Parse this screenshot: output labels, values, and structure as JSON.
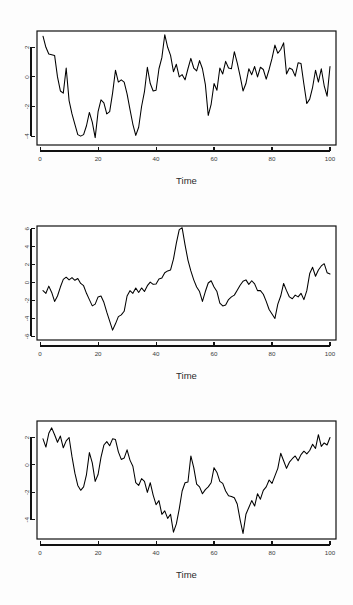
{
  "figure": {
    "kind": "r-base-plot",
    "panel_count": 3,
    "background": "#fdfdfd",
    "line_color": "#000000",
    "axis_color": "#111111"
  },
  "chart_data": [
    {
      "type": "line",
      "title": "",
      "subtitle": "",
      "xlabel": "Time",
      "ylabel": "",
      "grid": false,
      "legend": false,
      "xlim": [
        1,
        100
      ],
      "ylim": [
        -4.6,
        3.1
      ],
      "xticks": [
        0,
        20,
        40,
        60,
        80,
        100
      ],
      "yticks": [
        2,
        0,
        -2,
        -4
      ],
      "xticklabels": [
        "0",
        "20",
        "40",
        "60",
        "80",
        "100"
      ],
      "yticklabels": [
        "2",
        "0",
        "-2",
        "-4"
      ],
      "x": [
        1,
        2,
        3,
        4,
        5,
        6,
        7,
        8,
        9,
        10,
        11,
        12,
        13,
        14,
        15,
        16,
        17,
        18,
        19,
        20,
        21,
        22,
        23,
        24,
        25,
        26,
        27,
        28,
        29,
        30,
        31,
        32,
        33,
        34,
        35,
        36,
        37,
        38,
        39,
        40,
        41,
        42,
        43,
        44,
        45,
        46,
        47,
        48,
        49,
        50,
        51,
        52,
        53,
        54,
        55,
        56,
        57,
        58,
        59,
        60,
        61,
        62,
        63,
        64,
        65,
        66,
        67,
        68,
        69,
        70,
        71,
        72,
        73,
        74,
        75,
        76,
        77,
        78,
        79,
        80,
        81,
        82,
        83,
        84,
        85,
        86,
        87,
        88,
        89,
        90,
        91,
        92,
        93,
        94,
        95,
        96,
        97,
        98,
        99,
        100
      ],
      "values": [
        2.75,
        2.0,
        1.55,
        1.5,
        1.45,
        0.0,
        -0.95,
        -1.1,
        0.6,
        -1.6,
        -2.5,
        -3.2,
        -3.9,
        -4.0,
        -3.9,
        -3.3,
        -2.4,
        -3.05,
        -4.1,
        -2.35,
        -1.55,
        -1.75,
        -2.5,
        -2.35,
        -1.1,
        0.45,
        -0.35,
        -0.2,
        -0.35,
        -1.15,
        -2.2,
        -3.2,
        -3.95,
        -3.4,
        -2.0,
        -1.0,
        0.65,
        -0.45,
        -0.95,
        -0.9,
        0.55,
        1.3,
        2.85,
        2.0,
        1.45,
        0.35,
        0.85,
        0.0,
        0.15,
        -0.2,
        0.55,
        1.25,
        0.6,
        0.4,
        1.1,
        0.55,
        -0.5,
        -2.6,
        -1.85,
        -0.45,
        -0.9,
        0.6,
        0.2,
        1.05,
        0.6,
        0.55,
        1.7,
        0.95,
        0.05,
        -0.95,
        -0.45,
        0.55,
        0.15,
        0.7,
        0.0,
        0.65,
        0.5,
        -0.15,
        0.5,
        1.25,
        2.15,
        1.6,
        1.85,
        2.3,
        0.2,
        0.6,
        0.5,
        0.05,
        0.95,
        0.9,
        -0.5,
        -1.8,
        -1.5,
        -0.7,
        0.45,
        -0.35,
        0.55,
        -0.6,
        -1.3,
        0.7,
        0.35
      ]
    },
    {
      "type": "line",
      "title": "",
      "subtitle": "",
      "xlabel": "Time",
      "ylabel": "",
      "grid": false,
      "legend": false,
      "xlim": [
        1,
        100
      ],
      "ylim": [
        -6.4,
        6.3
      ],
      "xticks": [
        0,
        20,
        40,
        60,
        80,
        100
      ],
      "yticks": [
        6,
        4,
        2,
        0,
        -2,
        -4,
        -6
      ],
      "xticklabels": [
        "0",
        "20",
        "40",
        "60",
        "80",
        "100"
      ],
      "yticklabels": [
        "6",
        "4",
        "2",
        "0",
        "-2",
        "-4",
        "-6"
      ],
      "x": [
        1,
        2,
        3,
        4,
        5,
        6,
        7,
        8,
        9,
        10,
        11,
        12,
        13,
        14,
        15,
        16,
        17,
        18,
        19,
        20,
        21,
        22,
        23,
        24,
        25,
        26,
        27,
        28,
        29,
        30,
        31,
        32,
        33,
        34,
        35,
        36,
        37,
        38,
        39,
        40,
        41,
        42,
        43,
        44,
        45,
        46,
        47,
        48,
        49,
        50,
        51,
        52,
        53,
        54,
        55,
        56,
        57,
        58,
        59,
        60,
        61,
        62,
        63,
        64,
        65,
        66,
        67,
        68,
        69,
        70,
        71,
        72,
        73,
        74,
        75,
        76,
        77,
        78,
        79,
        80,
        81,
        82,
        83,
        84,
        85,
        86,
        87,
        88,
        89,
        90,
        91,
        92,
        93,
        94,
        95,
        96,
        97,
        98,
        99,
        100
      ],
      "values": [
        -0.9,
        -1.2,
        -0.4,
        -1.1,
        -2.1,
        -1.5,
        -0.5,
        0.35,
        0.6,
        0.3,
        0.55,
        0.25,
        0.45,
        -0.1,
        -0.35,
        -1.2,
        -1.9,
        -2.6,
        -2.4,
        -1.6,
        -1.5,
        -2.2,
        -3.3,
        -4.3,
        -5.3,
        -4.6,
        -3.8,
        -3.6,
        -3.2,
        -1.5,
        -0.9,
        -1.2,
        -0.6,
        -1.1,
        -0.6,
        -1.0,
        -0.35,
        0.05,
        -0.2,
        -0.15,
        0.4,
        0.5,
        1.1,
        1.3,
        1.4,
        2.6,
        4.4,
        5.9,
        6.1,
        4.2,
        2.5,
        1.3,
        0.3,
        -0.5,
        -1.0,
        -2.1,
        -1.0,
        -0.05,
        0.2,
        -0.5,
        -1.0,
        -2.3,
        -2.6,
        -2.5,
        -1.9,
        -1.6,
        -1.4,
        -0.85,
        -0.3,
        0.15,
        0.3,
        -0.2,
        0.2,
        -0.15,
        -0.9,
        -0.9,
        -1.3,
        -2.1,
        -3.0,
        -3.5,
        -4.0,
        -2.4,
        -1.5,
        -0.1,
        -0.9,
        -1.6,
        -1.8,
        -1.4,
        -1.6,
        -1.2,
        -1.9,
        -0.9,
        1.0,
        1.7,
        0.7,
        1.4,
        1.85,
        2.1,
        1.1,
        0.95
      ]
    },
    {
      "type": "line",
      "title": "",
      "subtitle": "",
      "xlabel": "Time",
      "ylabel": "",
      "grid": false,
      "legend": false,
      "xlim": [
        1,
        100
      ],
      "ylim": [
        -5.4,
        3.2
      ],
      "xticks": [
        0,
        20,
        40,
        60,
        80,
        100
      ],
      "yticks": [
        2,
        0,
        -2,
        -4
      ],
      "xticklabels": [
        "0",
        "20",
        "40",
        "60",
        "80",
        "100"
      ],
      "yticklabels": [
        "2",
        "0",
        "-2",
        "-4"
      ],
      "x": [
        1,
        2,
        3,
        4,
        5,
        6,
        7,
        8,
        9,
        10,
        11,
        12,
        13,
        14,
        15,
        16,
        17,
        18,
        19,
        20,
        21,
        22,
        23,
        24,
        25,
        26,
        27,
        28,
        29,
        30,
        31,
        32,
        33,
        34,
        35,
        36,
        37,
        38,
        39,
        40,
        41,
        42,
        43,
        44,
        45,
        46,
        47,
        48,
        49,
        50,
        51,
        52,
        53,
        54,
        55,
        56,
        57,
        58,
        59,
        60,
        61,
        62,
        63,
        64,
        65,
        66,
        67,
        68,
        69,
        70,
        71,
        72,
        73,
        74,
        75,
        76,
        77,
        78,
        79,
        80,
        81,
        82,
        83,
        84,
        85,
        86,
        87,
        88,
        89,
        90,
        91,
        92,
        93,
        94,
        95,
        96,
        97,
        98,
        99,
        100
      ],
      "values": [
        1.9,
        1.3,
        2.3,
        2.7,
        2.2,
        1.65,
        2.1,
        1.25,
        1.75,
        2.0,
        0.6,
        -0.6,
        -1.5,
        -1.85,
        -1.6,
        -0.7,
        0.9,
        0.15,
        -1.2,
        -0.7,
        0.55,
        1.45,
        1.7,
        1.4,
        1.9,
        1.85,
        0.95,
        0.4,
        0.5,
        1.1,
        0.35,
        -0.1,
        -1.3,
        -1.5,
        -1.0,
        -1.2,
        -2.0,
        -1.3,
        -2.2,
        -2.9,
        -2.6,
        -3.6,
        -3.35,
        -3.9,
        -3.6,
        -4.9,
        -4.3,
        -3.2,
        -1.9,
        -1.3,
        -1.25,
        0.65,
        -0.2,
        -1.4,
        -1.6,
        -2.1,
        -1.8,
        -1.6,
        -1.3,
        -0.2,
        -0.55,
        -1.2,
        -1.35,
        -1.9,
        -2.25,
        -2.3,
        -2.4,
        -2.85,
        -4.0,
        -5.0,
        -3.6,
        -3.1,
        -2.6,
        -3.0,
        -2.1,
        -2.5,
        -1.85,
        -1.6,
        -1.1,
        -1.35,
        -0.8,
        -0.25,
        0.85,
        0.3,
        -0.25,
        0.2,
        0.45,
        0.65,
        0.3,
        0.75,
        1.0,
        0.8,
        1.05,
        1.5,
        1.2,
        2.2,
        1.35,
        1.6,
        1.45,
        2.0
      ]
    }
  ],
  "panels": [
    {
      "xaxis_title": "Time"
    },
    {
      "xaxis_title": "Time"
    },
    {
      "xaxis_title": "Time"
    }
  ]
}
